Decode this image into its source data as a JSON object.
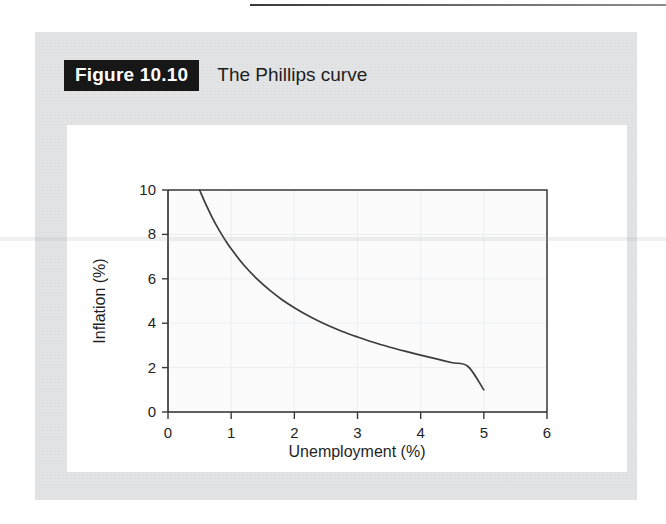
{
  "figure": {
    "number_label": "Figure 10.10",
    "caption": "The Phillips curve"
  },
  "colors": {
    "panel_background": "#e3e4e5",
    "card_background": "#ffffff",
    "number_box_background": "#171717",
    "number_box_text": "#ffffff",
    "curve": "#3c3c3c",
    "axis": "#2b2b2b",
    "grid": "#eceef0"
  },
  "chart_data": {
    "type": "line",
    "title": "The Phillips curve",
    "xlabel": "Unemployment (%)",
    "ylabel": "Inflation (%)",
    "xlim": [
      0,
      6
    ],
    "ylim": [
      0,
      10
    ],
    "xticks": [
      "0",
      "1",
      "2",
      "3",
      "4",
      "5",
      "6"
    ],
    "yticks": [
      "0",
      "2",
      "4",
      "6",
      "8",
      "10"
    ],
    "xtick_values": [
      0,
      1,
      2,
      3,
      4,
      5,
      6
    ],
    "ytick_values": [
      0,
      2,
      4,
      6,
      8,
      10
    ],
    "grid": true,
    "legend": "none",
    "series": [
      {
        "name": "Phillips curve",
        "x": [
          0.5,
          0.6,
          0.7,
          0.8,
          0.9,
          1.0,
          1.2,
          1.4,
          1.6,
          1.8,
          2.0,
          2.25,
          2.5,
          2.75,
          3.0,
          3.25,
          3.5,
          3.75,
          4.0,
          4.25,
          4.5,
          4.75,
          5.0
        ],
        "y": [
          10.0,
          9.35,
          8.76,
          8.24,
          7.77,
          7.35,
          6.62,
          6.02,
          5.51,
          5.07,
          4.7,
          4.29,
          3.94,
          3.64,
          3.38,
          3.14,
          2.93,
          2.74,
          2.56,
          2.39,
          2.22,
          2.05,
          1.0
        ]
      }
    ],
    "annotations": []
  }
}
